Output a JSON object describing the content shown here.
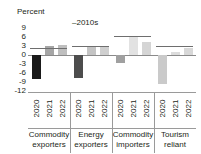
{
  "top_sliver_text": "",
  "axis": {
    "ylabel": "Percent",
    "yticks": [
      "9",
      "6",
      "3",
      "0",
      "-3",
      "-6",
      "-9",
      "-12"
    ],
    "ymin": -12,
    "ymax": 9
  },
  "series_note": "–2010s",
  "chart_data": {
    "type": "bar",
    "title": "",
    "subtitle": "",
    "xlabel": "",
    "ylabel": "Percent",
    "ylim": [
      -12,
      9
    ],
    "ytick_values": [
      9,
      6,
      3,
      0,
      -3,
      -6,
      -9,
      -12
    ],
    "grid": false,
    "legend": [
      "–2010s"
    ],
    "legend_position": "top-center",
    "annotations": [
      "–2010s"
    ],
    "categories": [
      "Commodity exporters",
      "Energy exporters",
      "Commodity importers",
      "Tourism reliant"
    ],
    "sub_categories": [
      "2020",
      "2021",
      "2022"
    ],
    "groups": [
      {
        "name": "Commodity exporters",
        "name_lines": [
          "Commodity",
          "exporters"
        ],
        "reference_2010s": 2.4,
        "bars": [
          {
            "year": "2020",
            "value": -8.0,
            "color": "#1a1a1a"
          },
          {
            "year": "2021",
            "value": 3.0,
            "color": "#a6a6a6"
          },
          {
            "year": "2022",
            "value": 3.4,
            "color": "#bfbfbf"
          }
        ]
      },
      {
        "name": "Energy exporters",
        "name_lines": [
          "Energy",
          "exporters"
        ],
        "reference_2010s": 3.0,
        "bars": [
          {
            "year": "2020",
            "value": -7.8,
            "color": "#4d4d4d"
          },
          {
            "year": "2021",
            "value": 2.6,
            "color": "#c4c4c4"
          },
          {
            "year": "2022",
            "value": 3.0,
            "color": "#cfcfcf"
          }
        ]
      },
      {
        "name": "Commodity importers",
        "name_lines": [
          "Commodity",
          "importers"
        ],
        "reference_2010s": 6.3,
        "bars": [
          {
            "year": "2020",
            "value": -2.6,
            "color": "#a0a0a0"
          },
          {
            "year": "2021",
            "value": 6.4,
            "color": "#e2e2e2"
          },
          {
            "year": "2022",
            "value": 4.2,
            "color": "#d5d5d5"
          }
        ]
      },
      {
        "name": "Tourism reliant",
        "name_lines": [
          "Tourism",
          "reliant"
        ],
        "reference_2010s": 3.0,
        "bars": [
          {
            "year": "2020",
            "value": -9.6,
            "color": "#cacaca"
          },
          {
            "year": "2021",
            "value": 1.1,
            "color": "#dcdcdc"
          },
          {
            "year": "2022",
            "value": 2.4,
            "color": "#d8d8d8"
          }
        ]
      }
    ]
  }
}
